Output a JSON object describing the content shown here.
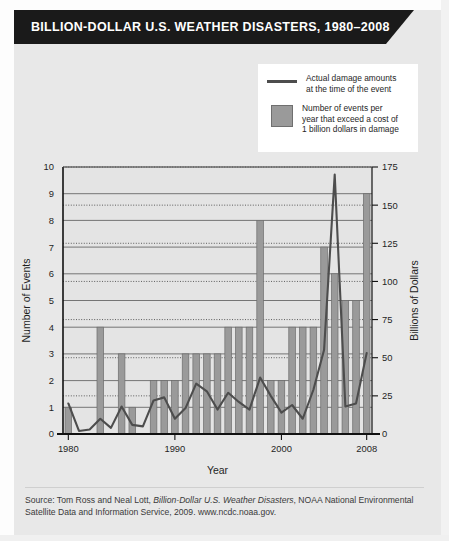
{
  "banner": {
    "title": "BILLION-DOLLAR  U.S. WEATHER DISASTERS, 1980–2008"
  },
  "legend": {
    "items": [
      {
        "swatch": "line",
        "label": "Actual damage amounts\nat the time of the event",
        "color": "#4d4d4d"
      },
      {
        "swatch": "box",
        "label": "Number of events per\nyear that exceed a cost of\n1 billion dollars in damage",
        "color": "#9a9a9a"
      }
    ]
  },
  "source": {
    "prefix": "Source: Tom Ross and Neal Lott, ",
    "italic": "Billion-Dollar U.S. Weather Disasters",
    "suffix": ", NOAA National Environmental Satellite Data and Information Service, 2009. www.ncdc.noaa.gov."
  },
  "chart_data": {
    "type": "bar",
    "title": "BILLION-DOLLAR  U.S. WEATHER DISASTERS, 1980–2008",
    "xlabel": "Year",
    "ylabel": "Number of Events",
    "y2label": "Billions of Dollars",
    "ylim": [
      0,
      10
    ],
    "y2lim": [
      0,
      175
    ],
    "yticks": [
      0,
      1,
      2,
      3,
      4,
      5,
      6,
      7,
      8,
      9,
      10
    ],
    "y2ticks": [
      0,
      25,
      50,
      75,
      100,
      125,
      150,
      175
    ],
    "xticks": [
      1980,
      1990,
      2000,
      2008
    ],
    "grid": true,
    "legend_position": "top-right",
    "bar_color": "#9a9a9a",
    "line_color": "#4d4d4d",
    "categories": [
      1980,
      1981,
      1982,
      1983,
      1984,
      1985,
      1986,
      1987,
      1988,
      1989,
      1990,
      1991,
      1992,
      1993,
      1994,
      1995,
      1996,
      1997,
      1998,
      1999,
      2000,
      2001,
      2002,
      2003,
      2004,
      2005,
      2006,
      2007,
      2008
    ],
    "series": [
      {
        "name": "Number of events per year that exceed a cost of 1 billion dollars in damage",
        "type": "bar",
        "axis": "left",
        "values": [
          1,
          0,
          0,
          4,
          0,
          3,
          1,
          0,
          2,
          2,
          2,
          3,
          3,
          3,
          3,
          4,
          4,
          4,
          8,
          2,
          2,
          4,
          4,
          4,
          7,
          6,
          5,
          5,
          9
        ]
      },
      {
        "name": "Actual damage amounts at the time of the event",
        "type": "line",
        "axis": "right",
        "values": [
          20,
          2,
          3,
          10,
          4,
          18,
          6,
          5,
          22,
          24,
          10,
          17,
          33,
          28,
          16,
          27,
          21,
          16,
          37,
          25,
          14,
          19,
          10,
          29,
          55,
          170,
          18,
          20,
          53
        ]
      }
    ]
  }
}
